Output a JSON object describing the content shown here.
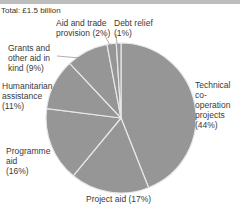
{
  "header": {
    "total_label": "Total: £1.5 billion"
  },
  "colors": {
    "slice_fill": "#969696",
    "slice_stroke": "#e8e8e8",
    "leader": "#9a9a9a",
    "header_band": "#bdbdbd"
  },
  "chart_data": {
    "type": "pie",
    "title": "",
    "subtitle": "Total: £1.5 billion",
    "start_angle": "12 o'clock, clockwise",
    "slices": [
      {
        "label": "Technical co-operation projects",
        "value": 44
      },
      {
        "label": "Project aid",
        "value": 17
      },
      {
        "label": "Programme aid",
        "value": 16
      },
      {
        "label": "Humanitarian assistance",
        "value": 11
      },
      {
        "label": "Grants and other aid in kind",
        "value": 9
      },
      {
        "label": "Aid and trade provision",
        "value": 2
      },
      {
        "label": "Debt relief",
        "value": 1
      }
    ],
    "unit": "%"
  },
  "labels": {
    "technical": "Technical\nco-operation\nprojects\n(44%)",
    "project": "Project aid (17%)",
    "programme": "Programme\naid\n(16%)",
    "humanitarian": "Humanitarian\nassistance\n(11%)",
    "grants": "Grants and\nother aid in\nkind (9%)",
    "aid_trade": "Aid and trade\nprovision (2%)",
    "debt": "Debt relief\n(1%)"
  }
}
